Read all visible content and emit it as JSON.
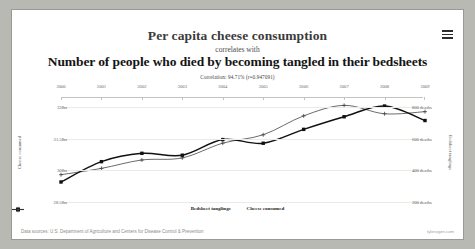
{
  "header": {
    "title_top": "Per capita cheese consumption",
    "connector": "correlates with",
    "title_bottom": "Number of people who died by becoming tangled in their bedsheets",
    "correlation_text": "Correlation: 94.71% (r=0.947091)",
    "menu_icon": "hamburger-menu-icon"
  },
  "footer": {
    "data_sources": "Data sources: U.S. Department of Agriculture and Centers for Disease Control & Prevention",
    "watermark": "tylervigen.com"
  },
  "legend": [
    {
      "label": "Bedsheet tanglings"
    },
    {
      "label": "Cheese consumed"
    }
  ],
  "chart_data": {
    "type": "line",
    "title": "Per capita cheese consumption correlates with Number of people who died by becoming tangled in their bedsheets",
    "subtitle": "Correlation: 94.71% (r=0.947091)",
    "xlabel": "",
    "x": [
      2000,
      2001,
      2002,
      2003,
      2004,
      2005,
      2006,
      2007,
      2008,
      2009
    ],
    "xtick_labels": [
      "2000",
      "2001",
      "2002",
      "2003",
      "2004",
      "2005",
      "2006",
      "2007",
      "2008",
      "2009"
    ],
    "grid": true,
    "legend_position": "bottom",
    "series": [
      {
        "name": "Bedsheet tanglings",
        "axis": "right",
        "ylabel": "Bedsheet tanglings",
        "yticks": [
          200,
          400,
          600,
          800
        ],
        "ytick_labels": [
          "200 deaths",
          "400 deaths",
          "600 deaths",
          "800 deaths"
        ],
        "ylim": [
          200,
          860
        ],
        "unit": "deaths",
        "values": [
          327,
          456,
          509,
          497,
          596,
          573,
          661,
          741,
          809,
          717
        ],
        "marker": "square",
        "color": "#111111"
      },
      {
        "name": "Cheese consumed",
        "axis": "left",
        "ylabel": "Cheese consumed",
        "yticks": [
          28.5,
          30,
          31.5,
          33
        ],
        "ytick_labels": [
          "28.5lbs",
          "30lbs",
          "31.5lbs",
          "33lbs"
        ],
        "ylim": [
          28.5,
          33.45
        ],
        "unit": "lbs",
        "values": [
          29.8,
          30.1,
          30.5,
          30.6,
          31.3,
          31.7,
          32.6,
          33.1,
          32.7,
          32.8
        ],
        "marker": "plus",
        "color": "#444444"
      }
    ]
  }
}
